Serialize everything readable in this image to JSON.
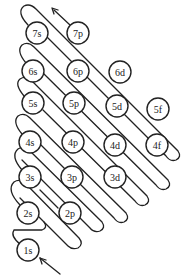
{
  "diagram": {
    "stroke_color": "#222222",
    "circle_fill": "#ffffff",
    "circle_radius": 11,
    "orbitals": [
      {
        "label": "7s",
        "x": 37,
        "y": 33
      },
      {
        "label": "7p",
        "x": 78,
        "y": 33
      },
      {
        "label": "6s",
        "x": 33,
        "y": 71
      },
      {
        "label": "6p",
        "x": 78,
        "y": 71
      },
      {
        "label": "6d",
        "x": 120,
        "y": 72
      },
      {
        "label": "5s",
        "x": 33,
        "y": 103
      },
      {
        "label": "5p",
        "x": 74,
        "y": 103
      },
      {
        "label": "5d",
        "x": 117,
        "y": 106
      },
      {
        "label": "5f",
        "x": 158,
        "y": 109
      },
      {
        "label": "4s",
        "x": 30,
        "y": 142
      },
      {
        "label": "4p",
        "x": 73,
        "y": 142
      },
      {
        "label": "4d",
        "x": 115,
        "y": 145
      },
      {
        "label": "4f",
        "x": 157,
        "y": 145
      },
      {
        "label": "3s",
        "x": 30,
        "y": 177
      },
      {
        "label": "3p",
        "x": 72,
        "y": 177
      },
      {
        "label": "3d",
        "x": 115,
        "y": 177
      },
      {
        "label": "2s",
        "x": 28,
        "y": 213
      },
      {
        "label": "2p",
        "x": 70,
        "y": 213
      },
      {
        "label": "1s",
        "x": 28,
        "y": 250
      }
    ]
  }
}
